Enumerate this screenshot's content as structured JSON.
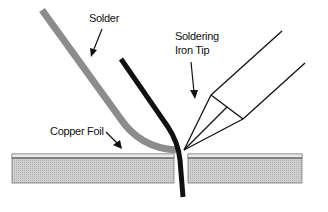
{
  "diagram": {
    "labels": {
      "solder": "Solder",
      "iron_line1": "Soldering",
      "iron_line2": "Iron Tip",
      "copper_foil": "Copper Foil"
    },
    "colors": {
      "solder": "#8c8c8c",
      "lead": "#111111",
      "board_fill": "#c8c8c8",
      "foil": "#e6e6e6",
      "outline": "#555555"
    }
  }
}
